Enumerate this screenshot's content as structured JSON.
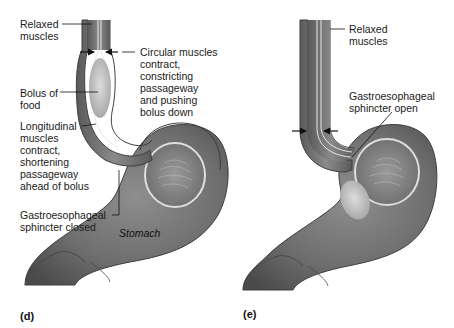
{
  "panels": [
    {
      "id": "(d)",
      "labels": {
        "relaxed_muscles": "Relaxed\nmuscles",
        "circular_muscles": "Circular muscles\ncontract,\nconstricting\npassageway\nand pushing\nbolus down",
        "bolus": "Bolus of\nfood",
        "longitudinal": "Longitudinal\nmuscles\ncontract,\nshortening\npassageway\nahead of bolus",
        "sphincter": "Gastroesophageal\nsphincter closed",
        "stomach": "Stomach"
      }
    },
    {
      "id": "(e)",
      "labels": {
        "relaxed_muscles": "Relaxed\nmuscles",
        "sphincter": "Gastroesophageal\nsphincter open"
      }
    }
  ],
  "colors": {
    "tissue_dark": "#5a5a5a",
    "tissue_mid": "#7d7d7d",
    "tissue_light": "#a8a8a8",
    "bolus": "#c9c9c9",
    "lining": "#e6e6e6",
    "text": "#1a1a1a"
  }
}
